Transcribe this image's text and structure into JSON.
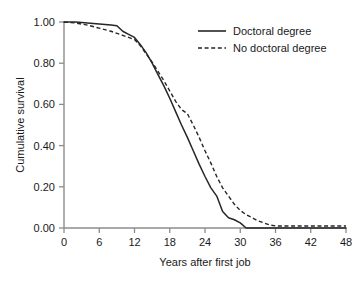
{
  "chart_data": {
    "type": "line",
    "title": "",
    "xlabel": "Years after first job",
    "ylabel": "Cumulative survival",
    "xlim": [
      0,
      48
    ],
    "ylim": [
      0,
      1.0
    ],
    "grid": false,
    "legend_position": "top-right",
    "xticks": [
      0,
      6,
      12,
      18,
      24,
      30,
      36,
      42,
      48
    ],
    "xtick_labels": [
      "0",
      "6",
      "12",
      "18",
      "24",
      "30",
      "36",
      "42",
      "48"
    ],
    "yticks": [
      0.0,
      0.2,
      0.4,
      0.6,
      0.8,
      1.0
    ],
    "ytick_labels": [
      "0.00",
      "0.20",
      "0.40",
      "0.60",
      "0.80",
      "1.00"
    ],
    "series": [
      {
        "name": "Doctoral degree",
        "style": "solid",
        "color": "#262626",
        "x": [
          0,
          2,
          4,
          6,
          8,
          9,
          10,
          11,
          12,
          13,
          14,
          15,
          16,
          17,
          18,
          19,
          20,
          21,
          22,
          23,
          24,
          25,
          26,
          27,
          28,
          29,
          30,
          31,
          32,
          36,
          42,
          48
        ],
        "y": [
          1.0,
          1.0,
          0.995,
          0.99,
          0.985,
          0.982,
          0.955,
          0.94,
          0.925,
          0.89,
          0.85,
          0.8,
          0.745,
          0.69,
          0.63,
          0.565,
          0.5,
          0.44,
          0.375,
          0.31,
          0.25,
          0.195,
          0.155,
          0.08,
          0.05,
          0.04,
          0.025,
          0.0,
          0.0,
          0.0,
          0.0,
          0.0
        ]
      },
      {
        "name": "No doctoral degree",
        "style": "dashed",
        "color": "#262626",
        "x": [
          0,
          2,
          4,
          6,
          8,
          10,
          11,
          12,
          13,
          14,
          15,
          16,
          17,
          18,
          19,
          20,
          21,
          22,
          23,
          24,
          25,
          26,
          27,
          28,
          29,
          30,
          31,
          32,
          33,
          34,
          35,
          36,
          38,
          40,
          42,
          44,
          46,
          48
        ],
        "y": [
          1.0,
          0.995,
          0.985,
          0.97,
          0.955,
          0.935,
          0.925,
          0.915,
          0.885,
          0.845,
          0.805,
          0.76,
          0.715,
          0.665,
          0.615,
          0.575,
          0.555,
          0.5,
          0.44,
          0.375,
          0.315,
          0.25,
          0.195,
          0.155,
          0.115,
          0.085,
          0.065,
          0.05,
          0.035,
          0.025,
          0.015,
          0.01,
          0.01,
          0.01,
          0.01,
          0.01,
          0.01,
          0.01
        ]
      }
    ]
  },
  "legend": {
    "items": [
      {
        "label": "Doctoral degree",
        "style": "solid"
      },
      {
        "label": "No doctoral degree",
        "style": "dashed"
      }
    ]
  },
  "axes": {
    "x_title": "Years after first job",
    "y_title": "Cumulative survival"
  },
  "colors": {
    "axis": "#8c8c8c",
    "series": "#262626",
    "text": "#1a1a1a",
    "background": "#ffffff"
  }
}
